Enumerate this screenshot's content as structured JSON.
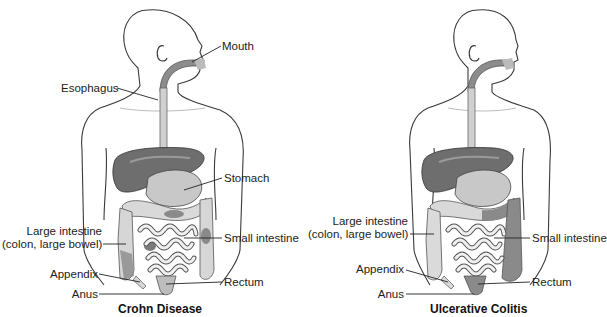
{
  "panels": [
    {
      "caption": "Crohn Disease",
      "labels": {
        "mouth": "Mouth",
        "esophagus": "Esophagus",
        "stomach": "Stomach",
        "large_intestine_1": "Large intestine",
        "large_intestine_2": "(colon, large bowel)",
        "small_intestine": "Small intestine",
        "appendix": "Appendix",
        "rectum": "Rectum",
        "anus": "Anus"
      }
    },
    {
      "caption": "Ulcerative Colitis",
      "labels": {
        "large_intestine_1": "Large intestine",
        "large_intestine_2": "(colon, large bowel)",
        "small_intestine": "Small intestine",
        "appendix": "Appendix",
        "rectum": "Rectum",
        "anus": "Anus"
      }
    }
  ],
  "colors": {
    "outline": "#3a3a3a",
    "liver": "#6e6e6e",
    "stomach": "#c8c8c8",
    "colon_healthy": "#dadada",
    "colon_diseased": "#8a8a8a",
    "small_intestine": "#f0f0f0",
    "esophagus": "#cfcfcf",
    "mouth_cavity": "#8c8c8c"
  }
}
